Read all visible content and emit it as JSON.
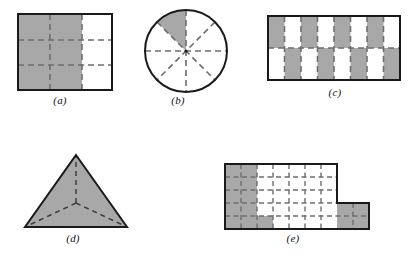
{
  "page": {
    "background": "#ffffff",
    "ink": "#111111",
    "shade_color": "#a8a8a8",
    "dash_color": "#6e6e6e",
    "outline_color": "#1a1a1a"
  },
  "figures": [
    {
      "id": "a",
      "label": "(a)",
      "shape": "square",
      "description": "square divided by dashed lines into a 3 by 3 grid of equal cells; the two left columns are shaded",
      "grid": {
        "columns": 3,
        "rows": 3
      },
      "total_parts": 9,
      "shaded_parts": 6,
      "fraction": "6/9",
      "shaded_cells": [
        [
          0,
          0
        ],
        [
          1,
          0
        ],
        [
          0,
          1
        ],
        [
          1,
          1
        ],
        [
          0,
          2
        ],
        [
          1,
          2
        ]
      ],
      "size": {
        "width": 96,
        "height": 78
      }
    },
    {
      "id": "b",
      "label": "(b)",
      "shape": "circle",
      "description": "circle cut by dashed diameters into 8 equal sectors; one upper-left sector is shaded",
      "sectors": 8,
      "total_parts": 8,
      "shaded_parts": 1,
      "fraction": "1/8",
      "shaded_sector_index": 1,
      "shaded_sector_range_deg": [
        270,
        315
      ],
      "size": {
        "width": 84,
        "height": 84
      }
    },
    {
      "id": "c",
      "label": "(c)",
      "shape": "rectangle",
      "description": "rectangle divided into 8 columns and 2 rows forming a checkerboard of shaded and white cells",
      "grid": {
        "columns": 8,
        "rows": 2
      },
      "total_parts": 16,
      "shaded_parts": 8,
      "fraction": "8/16",
      "pattern": "checkerboard",
      "shaded_cells": [
        [
          0,
          0
        ],
        [
          2,
          0
        ],
        [
          4,
          0
        ],
        [
          6,
          0
        ],
        [
          1,
          1
        ],
        [
          3,
          1
        ],
        [
          5,
          1
        ],
        [
          7,
          1
        ]
      ],
      "size": {
        "width": 133,
        "height": 64
      }
    },
    {
      "id": "d",
      "label": "(d)",
      "shape": "triangle",
      "description": "triangle split by dashed segments from the centroid to each vertex into 3 parts; all 3 parts are shaded",
      "total_parts": 3,
      "shaded_parts": 3,
      "fraction": "3/3",
      "size": {
        "width": 106,
        "height": 75
      }
    },
    {
      "id": "e",
      "label": "(e)",
      "shape": "L-shaped polygon",
      "description": "L-shaped region on a dashed unit grid; main block is 7 columns by 5 rows with a 2 by 2 block attached at the lower right; the left two columns, one extra cell in the bottom row, and the whole attached block are shaded",
      "grid": {
        "main_columns": 7,
        "main_rows": 5,
        "extension_columns": 2,
        "extension_rows": 2
      },
      "total_parts": 39,
      "shaded_parts": 15,
      "fraction": "15/39",
      "shaded_cells": [
        [
          0,
          0
        ],
        [
          1,
          0
        ],
        [
          0,
          1
        ],
        [
          1,
          1
        ],
        [
          0,
          2
        ],
        [
          1,
          2
        ],
        [
          0,
          3
        ],
        [
          1,
          3
        ],
        [
          0,
          4
        ],
        [
          1,
          4
        ],
        [
          2,
          4
        ],
        [
          7,
          3
        ],
        [
          8,
          3
        ],
        [
          7,
          4
        ],
        [
          8,
          4
        ]
      ],
      "size": {
        "width": 148,
        "height": 65
      }
    }
  ]
}
